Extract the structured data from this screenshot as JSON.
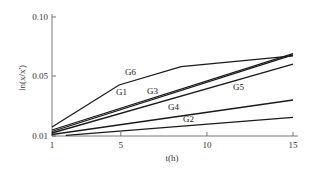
{
  "chart_data": {
    "type": "line",
    "title": "",
    "xlabel": "t(h)",
    "ylabel": "ln(x/x')",
    "xlim": [
      1,
      15
    ],
    "ylim": [
      0.01,
      0.1
    ],
    "x_ticks": [
      "1",
      "5",
      "10",
      "15"
    ],
    "y_ticks": [
      "0.01",
      "0.05",
      "0.10"
    ],
    "grid": false,
    "legend": "inline labels",
    "series": [
      {
        "name": "G6",
        "x": [
          1,
          4.9,
          8.5,
          15
        ],
        "values": [
          0.016,
          0.044,
          0.058,
          0.067
        ],
        "label_pos": [
          125,
          75
        ]
      },
      {
        "name": "G1",
        "x": [
          1,
          15
        ],
        "values": [
          0.014,
          0.069
        ],
        "label_pos": [
          116,
          95
        ]
      },
      {
        "name": "G3",
        "x": [
          1,
          15
        ],
        "values": [
          0.013,
          0.068
        ],
        "label_pos": [
          147,
          94
        ]
      },
      {
        "name": "G5",
        "x": [
          1,
          15
        ],
        "values": [
          0.012,
          0.06
        ],
        "label_pos": [
          233,
          90
        ]
      },
      {
        "name": "G4",
        "x": [
          1,
          15
        ],
        "values": [
          0.011,
          0.034
        ],
        "label_pos": [
          168,
          110
        ]
      },
      {
        "name": "G2",
        "x": [
          1.8,
          15
        ],
        "values": [
          0.0105,
          0.0225
        ],
        "label_pos": [
          183,
          122
        ]
      }
    ]
  }
}
